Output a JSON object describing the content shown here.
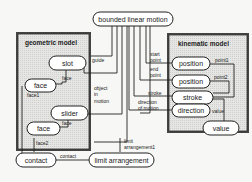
{
  "diagram": {
    "top_node": "bounded linear motion",
    "groups": {
      "geometric": {
        "title": "geometric model"
      },
      "kinematic": {
        "title": "kinematic model"
      }
    },
    "nodes": {
      "slot": "slot",
      "face1": "face",
      "slider": "slider",
      "face2": "face",
      "contact": "contact",
      "limit": "limit arrangement",
      "position1": "position",
      "position2": "position",
      "stroke": "stroke",
      "direction": "direction",
      "value": "value"
    },
    "edge_labels": {
      "guide": "guide",
      "slot_face": "face",
      "face1": "face1",
      "object_in_motion_1": "object",
      "object_in_motion_2": "in",
      "object_in_motion_3": "motion",
      "slider_face": "face",
      "face2": "face2",
      "contact": "contact",
      "limit_arrangement_1": "limit",
      "limit_arrangement_2": "arrangement1",
      "start_point_1": "start",
      "start_point_2": "point",
      "end_point_1": "end",
      "end_point_2": "point",
      "stroke": "stroke",
      "direction_of_motion_1": "direction",
      "direction_of_motion_2": "of motion",
      "point1": "point1",
      "point2": "point2",
      "value": "value"
    }
  }
}
